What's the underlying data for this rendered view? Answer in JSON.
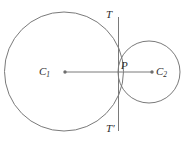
{
  "figure": {
    "colors": {
      "stroke": "#7a7a7a",
      "label": "#2b2b2b",
      "background": "#ffffff"
    },
    "labels": {
      "center_left": "C",
      "center_left_sub": "1",
      "center_right": "C",
      "center_right_sub": "2",
      "tangent_point": "P",
      "tangent_top": "T",
      "tangent_bottom": "T",
      "tangent_bottom_prime": "′"
    },
    "geometry": {
      "circle_large": {
        "cx": 64,
        "cy": 71.5,
        "r": 59.5
      },
      "circle_small": {
        "cx": 149,
        "cy": 72,
        "r": 31
      },
      "tangent_line": {
        "x": 118.5,
        "y1": 17,
        "y2": 131
      },
      "center_line": {
        "x1": 65,
        "y1": 72,
        "x2": 152,
        "y2": 72
      },
      "tangent_point": {
        "x": 118.5,
        "y": 72
      },
      "dot_left": {
        "cx": 65,
        "cy": 72,
        "r": 1.6
      },
      "dot_right": {
        "cx": 152,
        "cy": 72,
        "r": 1.6
      }
    }
  }
}
